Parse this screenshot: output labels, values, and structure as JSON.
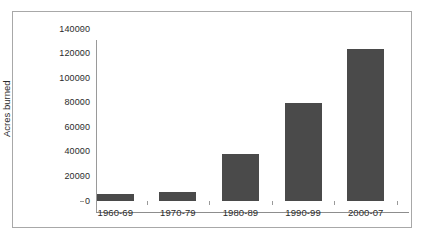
{
  "chart_data": {
    "type": "bar",
    "title": "",
    "subtitle": "",
    "xlabel": "",
    "ylabel": "Acres burned",
    "categories": [
      "1960-69",
      "1970-79",
      "1980-89",
      "1990-99",
      "2000-07"
    ],
    "values": [
      6000,
      7000,
      38500,
      80000,
      124000
    ],
    "series": [
      {
        "name": "Acres burned",
        "values": [
          6000,
          7000,
          38500,
          80000,
          124000
        ]
      }
    ],
    "ylim": [
      0,
      140000
    ],
    "y_ticks": [
      0,
      20000,
      40000,
      60000,
      80000,
      100000,
      120000,
      140000
    ],
    "y_tick_labels": [
      "0",
      "20000",
      "40000",
      "60000",
      "80000",
      "100000",
      "120000",
      "140000"
    ],
    "grid": false,
    "legend": false,
    "legend_position": "none",
    "bar_color": "#4a4a4a",
    "plot_background": "#ffffff",
    "frame_color": "#a8a8a8",
    "axis_color": "#9a9a9a",
    "text_color": "#2b2b2b"
  }
}
